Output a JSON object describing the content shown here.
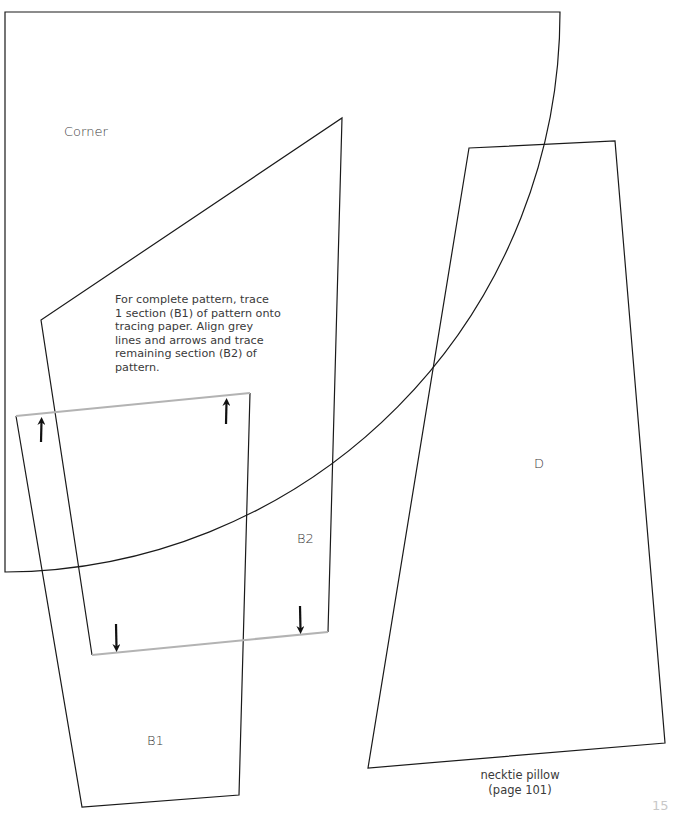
{
  "labels": {
    "corner": "Corner",
    "b2": "B2",
    "d": "D",
    "b1": "B1"
  },
  "instructions": {
    "lines": [
      "For complete pattern, trace",
      "1 section (B1) of pattern onto",
      "tracing paper. Align grey",
      "lines and arrows and trace",
      "remaining section (B2) of",
      "pattern."
    ]
  },
  "caption": {
    "line1": "necktie pillow",
    "line2": "(page 101)"
  },
  "page_number": "15",
  "colors": {
    "outline": "#1a1a1a",
    "alignment_line": "#b3b3b3",
    "arrow": "#111111",
    "text": "#3a3a3a",
    "page_number": "#c8c8c8"
  },
  "pieces": {
    "corner": {
      "shape": "quarter-circle",
      "corner": [
        5,
        12
      ],
      "radius": 558
    },
    "b2": {
      "points": [
        [
          41,
          320
        ],
        [
          342,
          118
        ],
        [
          328,
          632
        ],
        [
          92,
          655
        ]
      ]
    },
    "b1": {
      "points": [
        [
          16,
          416
        ],
        [
          250,
          393
        ],
        [
          239,
          795
        ],
        [
          82,
          807
        ]
      ]
    },
    "d": {
      "points": [
        [
          469,
          148
        ],
        [
          615,
          141
        ],
        [
          665,
          743
        ],
        [
          368,
          768
        ]
      ]
    },
    "alignment_lines": [
      {
        "from": [
          16,
          416
        ],
        "to": [
          250,
          393
        ]
      },
      {
        "from": [
          92,
          655
        ],
        "to": [
          328,
          632
        ]
      }
    ],
    "arrows": [
      {
        "direction": "up",
        "x": 41,
        "y_from": 442,
        "y_to": 417
      },
      {
        "direction": "up",
        "x": 226,
        "y_from": 424,
        "y_to": 398
      },
      {
        "direction": "down",
        "x": 116,
        "y_from": 624,
        "y_to": 652
      },
      {
        "direction": "down",
        "x": 300,
        "y_from": 606,
        "y_to": 634
      }
    ]
  }
}
